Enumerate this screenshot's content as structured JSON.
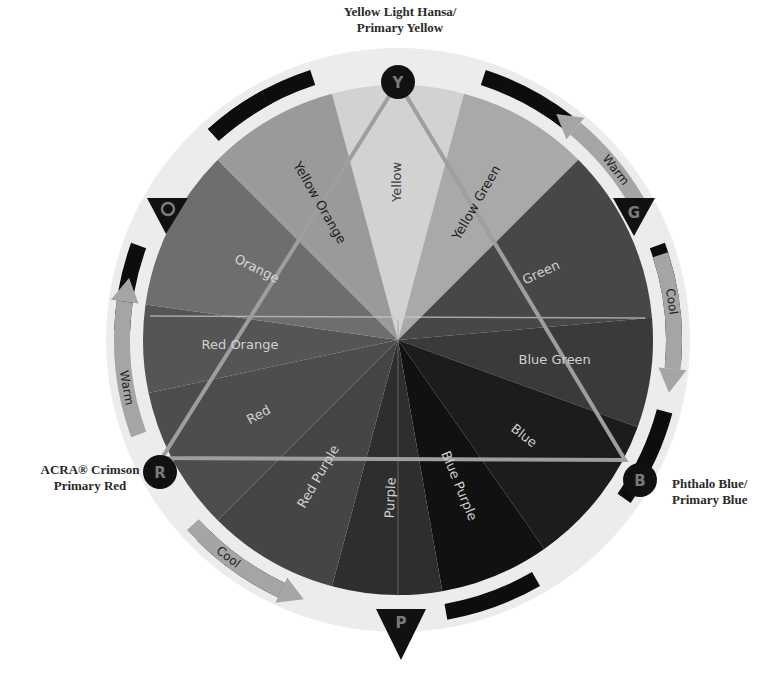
{
  "primaries": {
    "yellow": {
      "line1": "Yellow Light Hansa/",
      "line2": "Primary Yellow",
      "marker": "Y"
    },
    "red": {
      "line1": "ACRA® Crimson",
      "line2": "Primary Red",
      "marker": "R"
    },
    "blue": {
      "line1": "Phthalo Blue/",
      "line2": "Primary Blue",
      "marker": "B"
    }
  },
  "secondary_markers": {
    "orange": "O",
    "green": "G",
    "purple": "P"
  },
  "segments": [
    {
      "label": "Yellow",
      "start": -15,
      "end": 15,
      "fill": "#d2d2d2",
      "text": "#3a3a3a"
    },
    {
      "label": "Yellow Green",
      "start": 15,
      "end": 45,
      "fill": "#a9a9a9",
      "text": "#1e1e1e"
    },
    {
      "label": "Green",
      "start": 45,
      "end": 85,
      "fill": "#474747",
      "text": "#cfcfcf"
    },
    {
      "label": "Blue Green",
      "start": 85,
      "end": 110,
      "fill": "#3a3a3a",
      "text": "#d0d0d0"
    },
    {
      "label": "Blue",
      "start": 110,
      "end": 145,
      "fill": "#1c1c1c",
      "text": "#cfcfcf"
    },
    {
      "label": "Blue Purple",
      "start": 145,
      "end": 170,
      "fill": "#111111",
      "text": "#cfcfcf"
    },
    {
      "label": "Purple",
      "start": 170,
      "end": 195,
      "fill": "#2e2e2e",
      "text": "#cfcfcf"
    },
    {
      "label": "Red Purple",
      "start": 195,
      "end": 225,
      "fill": "#454545",
      "text": "#cfcfcf"
    },
    {
      "label": "Red",
      "start": 225,
      "end": 258,
      "fill": "#4d4d4d",
      "text": "#cfcfcf"
    },
    {
      "label": "Red Orange",
      "start": 258,
      "end": 278,
      "fill": "#555555",
      "text": "#d2d2d2"
    },
    {
      "label": "Orange",
      "start": 278,
      "end": 315,
      "fill": "#6e6e6e",
      "text": "#d8d8d8"
    },
    {
      "label": "Yellow Orange",
      "start": 315,
      "end": 345,
      "fill": "#9a9a9a",
      "text": "#1e1e1e"
    }
  ],
  "temperature_arrows": [
    {
      "label": "Warm",
      "position": "upper-right"
    },
    {
      "label": "Cool",
      "position": "right"
    },
    {
      "label": "Warm",
      "position": "left"
    },
    {
      "label": "Cool",
      "position": "lower-left"
    }
  ],
  "colors": {
    "ring": "#ebebeb",
    "ring_band": "#0d0d0d",
    "arrow": "#a5a5a5",
    "triangle": "#9d9d9d",
    "marker": "#111111"
  }
}
